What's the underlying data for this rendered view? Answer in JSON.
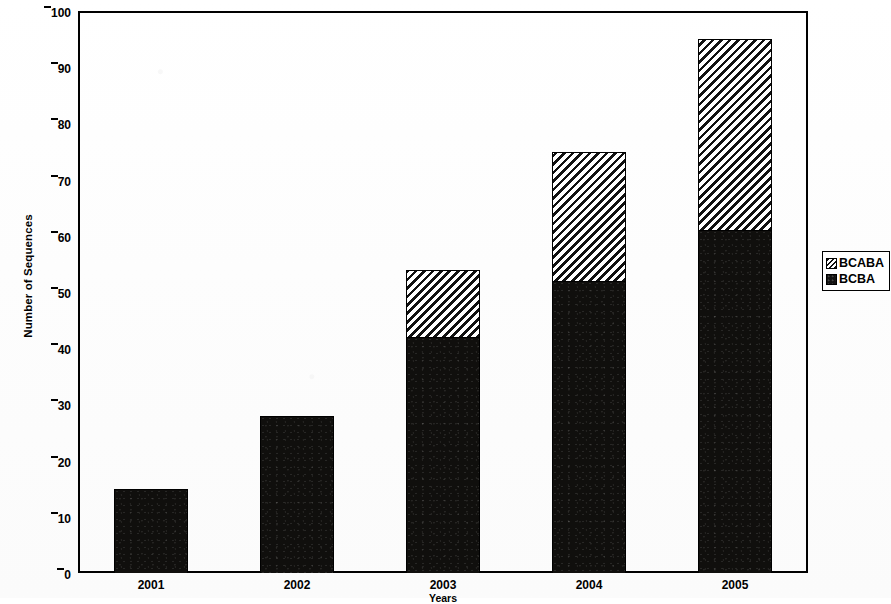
{
  "chart_data": {
    "type": "bar",
    "stacked": true,
    "title": "",
    "subtitle": "",
    "xlabel": "Years",
    "ylabel": "Number of Sequences",
    "categories": [
      "2001",
      "2002",
      "2003",
      "2004",
      "2005"
    ],
    "series": [
      {
        "name": "BCBA",
        "values": [
          15,
          28,
          42,
          52,
          61
        ],
        "fill": "dotted-solid-black",
        "color": "#100f0d"
      },
      {
        "name": "BCABA",
        "values": [
          0,
          0,
          12,
          23,
          34
        ],
        "fill": "diagonal-hatch",
        "color": "#111111"
      }
    ],
    "totals": [
      15,
      28,
      54,
      75,
      95
    ],
    "ylim": [
      0,
      100
    ],
    "yticks": [
      0,
      10,
      20,
      30,
      40,
      50,
      60,
      70,
      80,
      90,
      100
    ],
    "ytick_labels": [
      "0",
      "10",
      "20",
      "30",
      "40",
      "50",
      "60",
      "70",
      "80",
      "90",
      "100"
    ],
    "grid": false,
    "legend_position": "right",
    "legend_entries": [
      "BCABA",
      "BCBA"
    ],
    "frame": true
  },
  "axes": {
    "y_title": "Number of Sequences",
    "x_title": "Years"
  }
}
